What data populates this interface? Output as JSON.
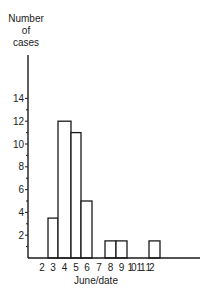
{
  "chart_data": {
    "type": "bar",
    "title": "",
    "ylabel_lines": [
      "Number",
      "of",
      "cases"
    ],
    "ylabel": "Number of cases",
    "xlabel": "June/date",
    "categories": [
      "2",
      "3",
      "4",
      "5",
      "6",
      "7",
      "8",
      "9",
      "10",
      "11",
      "12"
    ],
    "values": [
      0,
      3.5,
      12,
      11,
      5,
      0,
      1.5,
      1.5,
      0,
      0,
      1.5
    ],
    "y_ticks": [
      2,
      4,
      6,
      8,
      10,
      12,
      14
    ],
    "y_minor_ticks": [
      1,
      3,
      5,
      7,
      9,
      11,
      13
    ],
    "ylim": [
      0,
      17.5
    ],
    "grid": false,
    "legend": null,
    "bar_style": "outlined, no fill, adjacent (histogram)"
  }
}
